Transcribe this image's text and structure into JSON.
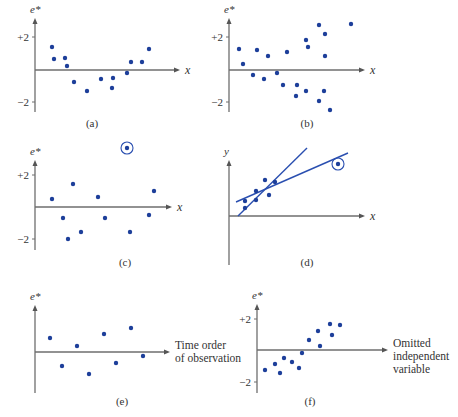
{
  "chart_data": [
    {
      "panel": "a",
      "type": "scatter",
      "caption": "(a)",
      "ylabel": "e*",
      "xlabel": "x",
      "yticks": [
        "+2",
        "−2"
      ],
      "origin": [
        35,
        70
      ],
      "ytop": 18,
      "xright": 180,
      "ybottom": 112,
      "tick_plus2": 37,
      "tick_minus2": 102,
      "caption_pos": [
        92,
        127
      ],
      "points": [
        [
          52,
          47
        ],
        [
          54,
          59
        ],
        [
          65,
          58
        ],
        [
          67,
          66
        ],
        [
          74,
          82
        ],
        [
          87,
          91
        ],
        [
          101,
          79
        ],
        [
          112,
          88
        ],
        [
          113,
          78
        ],
        [
          127,
          73
        ],
        [
          131,
          62
        ],
        [
          142,
          62
        ],
        [
          149,
          49
        ]
      ]
    },
    {
      "panel": "b",
      "type": "scatter",
      "caption": "(b)",
      "ylabel": "e*",
      "xlabel": "x",
      "yticks": [
        "+2",
        "−2"
      ],
      "origin": [
        229,
        70
      ],
      "ytop": 18,
      "xright": 365,
      "ybottom": 112,
      "tick_plus2": 37,
      "tick_minus2": 102,
      "caption_pos": [
        307,
        127
      ],
      "points": [
        [
          239,
          49
        ],
        [
          243,
          64
        ],
        [
          257,
          50
        ],
        [
          253,
          75
        ],
        [
          268,
          56
        ],
        [
          264,
          79
        ],
        [
          277,
          73
        ],
        [
          287,
          52
        ],
        [
          283,
          85
        ],
        [
          297,
          85
        ],
        [
          306,
          40
        ],
        [
          308,
          47
        ],
        [
          296,
          96
        ],
        [
          306,
          91
        ],
        [
          319,
          25
        ],
        [
          325,
          34
        ],
        [
          325,
          56
        ],
        [
          324,
          91
        ],
        [
          319,
          101
        ],
        [
          330,
          110
        ],
        [
          351,
          24
        ]
      ]
    },
    {
      "panel": "c",
      "type": "scatter",
      "caption": "(c)",
      "ylabel": "e*",
      "xlabel": "x",
      "yticks": [
        "+2",
        "−2"
      ],
      "origin": [
        35,
        207
      ],
      "ytop": 160,
      "xright": 172,
      "ybottom": 250,
      "tick_plus2": 175,
      "tick_minus2": 239,
      "caption_pos": [
        125,
        266
      ],
      "points": [
        [
          52,
          199
        ],
        [
          63,
          218
        ],
        [
          73,
          184
        ],
        [
          68,
          239
        ],
        [
          81,
          232
        ],
        [
          98,
          197
        ],
        [
          105,
          218
        ],
        [
          130,
          232
        ],
        [
          149,
          215
        ],
        [
          154,
          191
        ]
      ],
      "outliers": [
        [
          127,
          148
        ]
      ]
    },
    {
      "panel": "d",
      "type": "scatter",
      "caption": "(d)",
      "ylabel": "y",
      "xlabel": "x",
      "yticks": [],
      "origin": [
        229,
        216
      ],
      "ytop": 160,
      "xright": 365,
      "ybottom": 265,
      "caption_pos": [
        307,
        266
      ],
      "points": [
        [
          245,
          201
        ],
        [
          245,
          208
        ],
        [
          256,
          191
        ],
        [
          256,
          200
        ],
        [
          265,
          180
        ],
        [
          269,
          195
        ],
        [
          275,
          182
        ]
      ],
      "outliers": [
        [
          338,
          164
        ]
      ],
      "lines": [
        [
          [
            238,
            216
          ],
          [
            307,
            148
          ]
        ],
        [
          [
            236,
            202
          ],
          [
            348,
            153
          ]
        ]
      ]
    },
    {
      "panel": "e",
      "type": "scatter",
      "caption": "(e)",
      "ylabel": "e*",
      "xlabel_lines": [
        "Time order",
        "of observation"
      ],
      "yticks": [],
      "origin": [
        35,
        352
      ],
      "ytop": 305,
      "xright": 170,
      "ybottom": 393,
      "caption_pos": [
        122,
        405
      ],
      "points": [
        [
          50,
          338
        ],
        [
          62,
          366
        ],
        [
          77,
          346
        ],
        [
          89,
          374
        ],
        [
          104,
          334
        ],
        [
          116,
          363
        ],
        [
          131,
          328
        ],
        [
          143,
          356
        ]
      ]
    },
    {
      "panel": "f",
      "type": "scatter",
      "caption": "(f)",
      "ylabel": "e*",
      "xlabel_lines": [
        "Omitted",
        "independent",
        "variable"
      ],
      "yticks": [
        "+2",
        "−2"
      ],
      "origin": [
        257,
        350
      ],
      "ytop": 304,
      "xright": 388,
      "ybottom": 393,
      "tick_plus2": 319,
      "tick_minus2": 382,
      "caption_pos": [
        310,
        405
      ],
      "points": [
        [
          265,
          370
        ],
        [
          275,
          364
        ],
        [
          280,
          373
        ],
        [
          284,
          358
        ],
        [
          292,
          362
        ],
        [
          299,
          368
        ],
        [
          302,
          353
        ],
        [
          309,
          340
        ],
        [
          318,
          331
        ],
        [
          320,
          346
        ],
        [
          330,
          324
        ],
        [
          332,
          335
        ],
        [
          340,
          325
        ]
      ]
    }
  ]
}
